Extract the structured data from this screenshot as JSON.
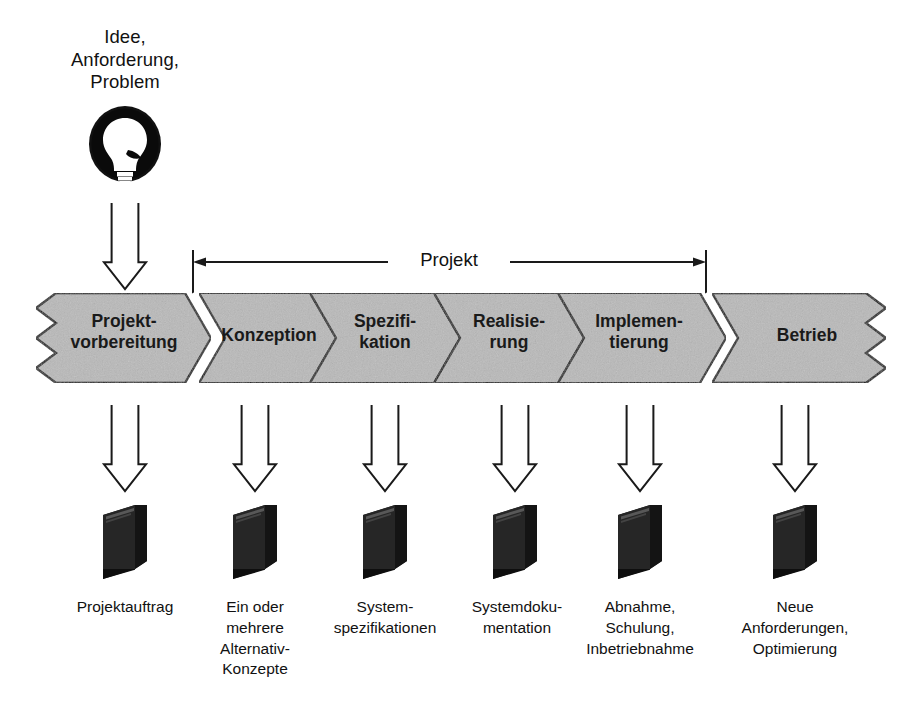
{
  "diagram": {
    "background_color": "#ffffff",
    "band_fill_color": "#b9b9b9",
    "ink_color": "#000000"
  },
  "source": {
    "icon": "lightbulb-icon",
    "label_lines": [
      "Idee,",
      "Anforderung,",
      "Problem"
    ],
    "label_text": "Idee, Anforderung, Problem"
  },
  "bracket": {
    "label": "Projekt",
    "spans_from_phase": "Konzeption",
    "spans_to_phase": "Implementierung",
    "arrow_style": "double-headed"
  },
  "phases": [
    {
      "id": "projektvorbereitung",
      "lines": [
        "Projekt-",
        "vorbereitung"
      ],
      "text": "Projektvorbereitung",
      "in_project_bracket": false
    },
    {
      "id": "konzeption",
      "lines": [
        "Konzeption"
      ],
      "text": "Konzeption",
      "in_project_bracket": true
    },
    {
      "id": "spezifikation",
      "lines": [
        "Spezifi-",
        "kation"
      ],
      "text": "Spezifikation",
      "in_project_bracket": true
    },
    {
      "id": "realisierung",
      "lines": [
        "Realisie-",
        "rung"
      ],
      "text": "Realisierung",
      "in_project_bracket": true
    },
    {
      "id": "implementierung",
      "lines": [
        "Implemen-",
        "tierung"
      ],
      "text": "Implementierung",
      "in_project_bracket": true
    },
    {
      "id": "betrieb",
      "lines": [
        "Betrieb"
      ],
      "text": "Betrieb",
      "in_project_bracket": false
    }
  ],
  "deliverables": [
    {
      "id": "projektauftrag",
      "icon": "document-stack-icon",
      "lines": [
        "Projektauftrag"
      ],
      "text": "Projektauftrag"
    },
    {
      "id": "alternativ",
      "icon": "document-stack-icon",
      "lines": [
        "Ein oder",
        "mehrere",
        "Alternativ-",
        "Konzepte"
      ],
      "text": "Ein oder mehrere Alternativ-Konzepte"
    },
    {
      "id": "spezifikationen",
      "icon": "document-stack-icon",
      "lines": [
        "System-",
        "spezifikationen"
      ],
      "text": "Systemspezifikationen"
    },
    {
      "id": "dokumentation",
      "icon": "document-stack-icon",
      "lines": [
        "Systemdoku-",
        "mentation"
      ],
      "text": "Systemdokumentation"
    },
    {
      "id": "abnahme",
      "icon": "document-stack-icon",
      "lines": [
        "Abnahme,",
        "Schulung,",
        "Inbetriebnahme"
      ],
      "text": "Abnahme, Schulung, Inbetriebnahme"
    },
    {
      "id": "neueanford",
      "icon": "document-stack-icon",
      "lines": [
        "Neue",
        "Anforderungen,",
        "Optimierung"
      ],
      "text": "Neue Anforderungen, Optimierung"
    }
  ]
}
